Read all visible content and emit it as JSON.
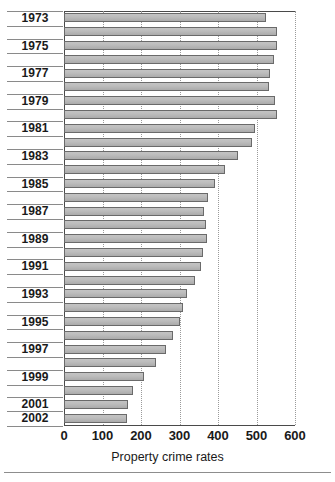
{
  "chart_data": {
    "type": "bar",
    "orientation": "horizontal",
    "title": "",
    "xlabel": "Property crime rates",
    "ylabel": "",
    "xlim": [
      0,
      600
    ],
    "xticks": [
      0,
      100,
      200,
      300,
      400,
      500,
      600
    ],
    "grid": "vertical dotted gridlines at each x tick",
    "legend": "none",
    "bar_color": "#b6b6b6",
    "bar_border_color": "#6a6a6a",
    "categories": [
      "1973",
      "1974",
      "1975",
      "1976",
      "1977",
      "1978",
      "1979",
      "1980",
      "1981",
      "1982",
      "1983",
      "1984",
      "1985",
      "1986",
      "1987",
      "1988",
      "1989",
      "1990",
      "1991",
      "1992",
      "1993",
      "1994",
      "1995",
      "1996",
      "1997",
      "1998",
      "1999",
      "2000",
      "2001",
      "2002"
    ],
    "values": [
      525,
      552,
      553,
      545,
      534,
      533,
      548,
      553,
      495,
      489,
      452,
      418,
      391,
      375,
      364,
      370,
      372,
      362,
      355,
      340,
      320,
      310,
      302,
      283,
      265,
      240,
      208,
      180,
      165,
      163
    ],
    "visible_ytick_labels": [
      "1973",
      "1975",
      "1977",
      "1979",
      "1981",
      "1983",
      "1985",
      "1987",
      "1989",
      "1991",
      "1993",
      "1995",
      "1997",
      "1999",
      "2001",
      "2002"
    ]
  }
}
